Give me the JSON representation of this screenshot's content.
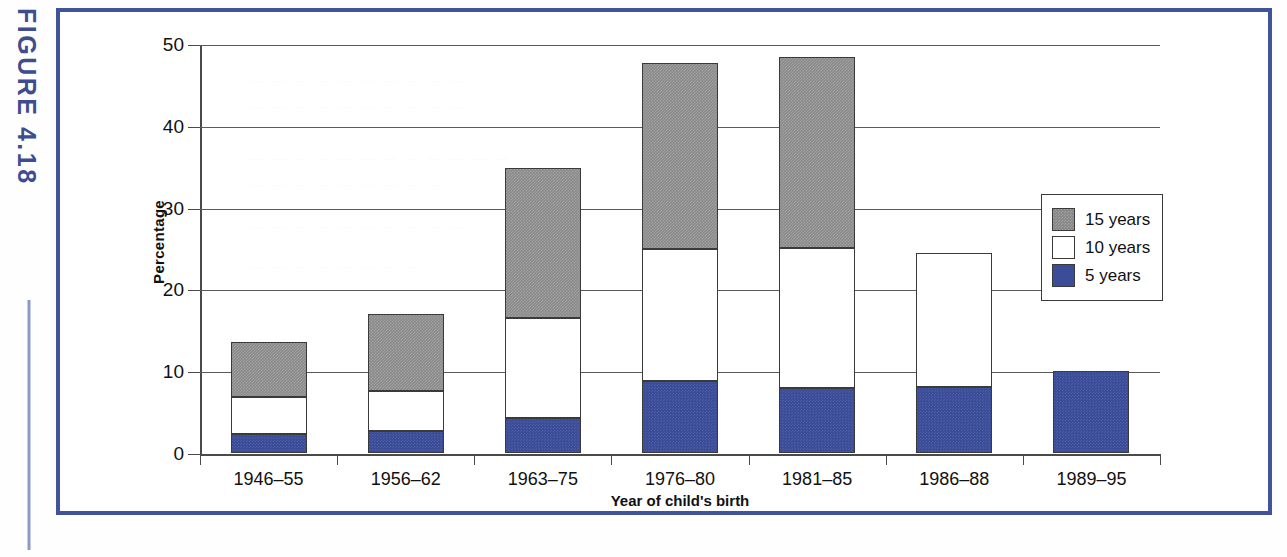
{
  "figure": {
    "label": "FIGURE 4.18"
  },
  "chart_data": {
    "type": "bar",
    "subtype": "stacked-vertical",
    "title": "",
    "xlabel": "Year of child's birth",
    "ylabel": "Percentage",
    "ylim": [
      0,
      50
    ],
    "yticks": [
      0,
      10,
      20,
      30,
      40,
      50
    ],
    "ytick_labels": [
      "0",
      "10",
      "20",
      "30",
      "40",
      "50"
    ],
    "grid": "horizontal",
    "legend_position": "right",
    "categories": [
      "1946–55",
      "1956–62",
      "1963–75",
      "1976–80",
      "1981–85",
      "1986–88",
      "1989–95"
    ],
    "series": [
      {
        "name": "5 years",
        "color": "#3b4c99",
        "values": [
          2.3,
          2.7,
          4.3,
          8.8,
          8.0,
          8.1,
          10.0
        ]
      },
      {
        "name": "10 years",
        "color": "#ffffff",
        "values": [
          4.5,
          4.9,
          12.2,
          16.2,
          17.1,
          16.4,
          0.0
        ]
      },
      {
        "name": "15 years",
        "color": "#8a8a8a",
        "values": [
          6.8,
          9.4,
          18.3,
          22.7,
          23.3,
          0.0,
          0.0
        ]
      }
    ],
    "cumulative_totals": [
      13.6,
      17.0,
      34.8,
      47.7,
      48.4,
      24.5,
      10.0
    ],
    "legend": [
      {
        "label": "15 years",
        "color": "#8a8a8a"
      },
      {
        "label": "10 years",
        "color": "#ffffff"
      },
      {
        "label": "5 years",
        "color": "#3b4c99"
      }
    ]
  },
  "colors": {
    "frame": "#41549a",
    "figure_label": "#3d4d8f",
    "axis": "#4a4a4a",
    "gridline": "#5a5a5a"
  }
}
